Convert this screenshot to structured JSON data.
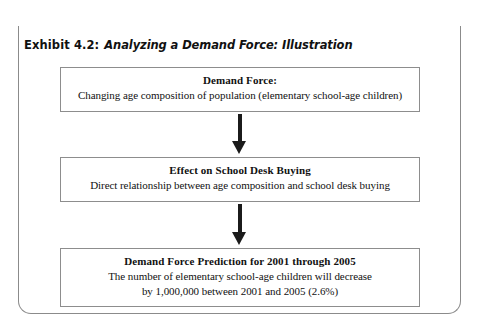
{
  "exhibit": {
    "label": "Exhibit 4.2:",
    "subject": "Analyzing a Demand Force: Illustration",
    "accent_color": "#1b1b1b",
    "frame_border_color": "#8b8b8b",
    "box_border_color": "#8d8d8d",
    "text_color": "#111111",
    "background_color": "#ffffff"
  },
  "flow": {
    "boxes": [
      {
        "id": "demand-force",
        "title": "Demand Force:",
        "lines": [
          "Changing age composition of population (elementary school-age children)"
        ]
      },
      {
        "id": "effect",
        "title": "Effect on School Desk Buying",
        "lines": [
          "Direct relationship between age composition and school desk buying"
        ]
      },
      {
        "id": "prediction",
        "title": "Demand Force Prediction for 2001 through 2005",
        "lines": [
          "The number of elementary school-age children will decrease",
          "by 1,000,000 between 2001 and 2005 (2.6%)"
        ]
      }
    ],
    "connectors": [
      {
        "id": "arrow-1",
        "icon": "arrow-down-icon",
        "from": "demand-force",
        "to": "effect"
      },
      {
        "id": "arrow-2",
        "icon": "arrow-down-icon",
        "from": "effect",
        "to": "prediction"
      }
    ]
  }
}
